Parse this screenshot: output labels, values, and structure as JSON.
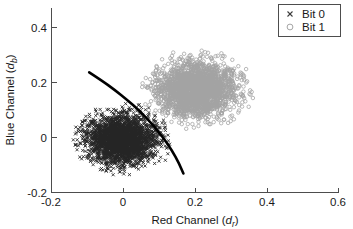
{
  "figure": {
    "background_color": "#ffffff",
    "axis_color": "#4d4d4d",
    "boundary_color": "#000000"
  },
  "axes": {
    "x_title_main": "Red Channel (",
    "x_title_var": "d",
    "x_title_sub": "r",
    "x_title_close": ")",
    "y_title_main": "Blue Channel (",
    "y_title_var": "d",
    "y_title_sub": "b",
    "y_title_close": ")",
    "x_ticks": [
      "-0.2",
      "0",
      "0.2",
      "0.4",
      "0.6"
    ],
    "y_ticks": [
      "0.4",
      "0.2",
      "0",
      "-0.2"
    ]
  },
  "legend": {
    "position": "top-right",
    "entries": [
      {
        "label": "Bit 0",
        "marker": "cross-marker",
        "color": "#3c3c3c"
      },
      {
        "label": "Bit 1",
        "marker": "circle-marker",
        "color": "#9a9a9a"
      }
    ]
  },
  "chart_data": {
    "type": "scatter",
    "title": "",
    "xlabel": "Red Channel (d_r)",
    "ylabel": "Blue Channel (d_b)",
    "xlim": [
      -0.2,
      0.6
    ],
    "ylim": [
      -0.2,
      0.5
    ],
    "xticks": [
      -0.2,
      0,
      0.2,
      0.4,
      0.6
    ],
    "yticks": [
      -0.2,
      0,
      0.2,
      0.4
    ],
    "grid": false,
    "legend_position": "upper right",
    "series": [
      {
        "name": "Bit 0",
        "marker": "x",
        "color": "#000000",
        "center": [
          -0.005,
          0.0
        ],
        "spread_x": 0.048,
        "spread_y": 0.046,
        "n_points": 2600
      },
      {
        "name": "Bit 1",
        "marker": "o",
        "color": "#808080",
        "center": [
          0.203,
          0.192
        ],
        "spread_x": 0.053,
        "spread_y": 0.05,
        "n_points": 2400
      }
    ],
    "annotations": [
      {
        "name": "decision-boundary",
        "type": "curve",
        "description": "quadratic decision boundary separating Bit 0 and Bit 1 clusters",
        "points": [
          [
            -0.095,
            0.256
          ],
          [
            -0.06,
            0.225
          ],
          [
            -0.025,
            0.19
          ],
          [
            0.01,
            0.152
          ],
          [
            0.045,
            0.11
          ],
          [
            0.08,
            0.06
          ],
          [
            0.11,
            0.01
          ],
          [
            0.135,
            -0.04
          ],
          [
            0.155,
            -0.09
          ],
          [
            0.167,
            -0.128
          ]
        ]
      }
    ]
  }
}
